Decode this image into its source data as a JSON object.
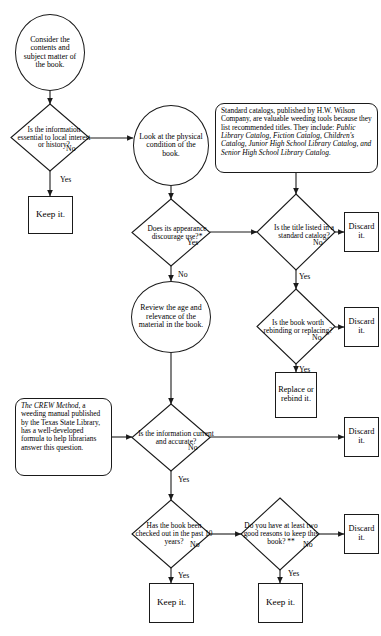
{
  "diagram": {
    "type": "flowchart",
    "line_color": "#1a1a1a",
    "background": "#ffffff"
  },
  "nodes": {
    "start_consider": "Consider the contents and subject matter of the book.",
    "q_local_interest": "Is the information essential to local interest or history?",
    "keep_1": "Keep it.",
    "proc_physical": "Look at the physical condition of the book.",
    "note_catalogs_plain_1": "Standard catalogs, published by H.W. Wilson Company, are valuable weeding tools because they list recommended titles.  They include: ",
    "note_catalogs_italic": "Public Library Catalog, Fiction Catalog, Children's Catalog, Junior High School Library Catalog, and Senior High School Library Catalog.",
    "q_appearance": "Does its appearance discourage use?*",
    "q_standard_catalog": "Is the title listed in a standard catalog?",
    "discard_1": "Discard it.",
    "proc_review_age": "Review the age and relevance of the material in the book.",
    "q_worth_rebinding": "Is the book worth rebinding or replacing?",
    "discard_2": "Discard it.",
    "replace_rebind": "Replace or rebind it.",
    "note_crew_italic": "The CREW Method",
    "note_crew_plain": ", a weeding manual published by the Texas State Library, has a well-developed formula to help librarians answer this question.",
    "q_current_accurate": "Is the information current and accurate?",
    "discard_3": "Discard it.",
    "q_checked_out": "Has the book been checked out in the past 10 years?",
    "q_two_reasons": "Do you have at least two good reasons to keep this book? **",
    "discard_4": "Discard it.",
    "keep_2": "Keep it.",
    "keep_3": "Keep it."
  },
  "edge_labels": {
    "local_interest_no": "No",
    "local_interest_yes": "Yes",
    "appearance_yes": "Yes",
    "appearance_no": "No",
    "catalog_no": "No",
    "catalog_yes": "Yes",
    "rebinding_no": "No",
    "rebinding_yes": "Yes",
    "current_no": "No",
    "current_yes": "Yes",
    "checked_out_no": "No",
    "checked_out_yes": "Yes",
    "two_reasons_no": "No",
    "two_reasons_yes": "Yes"
  }
}
